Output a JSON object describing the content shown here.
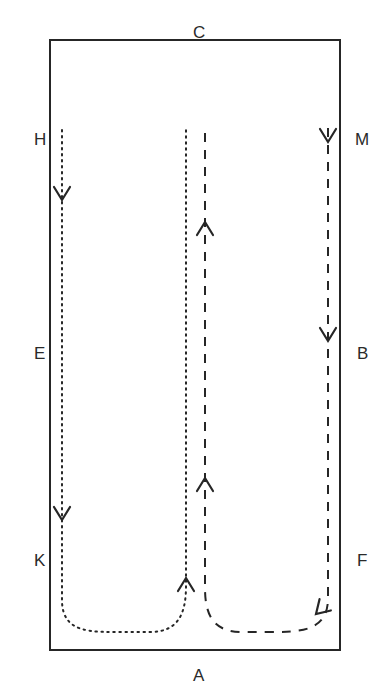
{
  "figure": {
    "type": "flow-diagram",
    "background_color": "#ffffff",
    "stroke_color": "#262626",
    "width": 387,
    "height": 698
  },
  "boundary": {
    "name": "rectangle-boundary",
    "x": 50,
    "y": 40,
    "width": 290,
    "height": 610,
    "stroke_width": 2,
    "stroke_color": "#262626",
    "fill": "none"
  },
  "labels": [
    {
      "id": "label-c",
      "text": "C",
      "x": 193,
      "y": 24,
      "side": "top"
    },
    {
      "id": "label-h",
      "text": "H",
      "x": 34,
      "y": 131,
      "side": "left"
    },
    {
      "id": "label-m",
      "text": "M",
      "x": 355,
      "y": 131,
      "side": "right"
    },
    {
      "id": "label-e",
      "text": "E",
      "x": 34,
      "y": 345,
      "side": "left"
    },
    {
      "id": "label-b",
      "text": "B",
      "x": 357,
      "y": 345,
      "side": "right"
    },
    {
      "id": "label-k",
      "text": "K",
      "x": 34,
      "y": 552,
      "side": "left"
    },
    {
      "id": "label-f",
      "text": "F",
      "x": 357,
      "y": 552,
      "side": "right"
    },
    {
      "id": "label-a",
      "text": "A",
      "x": 193,
      "y": 667,
      "side": "bottom"
    }
  ],
  "paths": [
    {
      "id": "dotted-path",
      "style": "dotted",
      "dasharray": "1.5,4.5",
      "stroke_width": 2,
      "stroke_color": "#262626",
      "description": "descends along left side from H, U-turns at bottom near A, ascends through centre",
      "d": "M 62 130 L 62 600 C 62 634 92 632 124 632 L 150 632 C 178 632 186 614 186 586 L 186 130"
    },
    {
      "id": "dashed-path",
      "style": "dashed",
      "dasharray": "9,8",
      "stroke_width": 2,
      "stroke_color": "#262626",
      "description": "descends along right side from M, U-turns at bottom near A, ascends through centre",
      "d": "M 328 128 L 328 598 C 328 632 300 632 268 632 L 242 632 C 214 632 205 616 205 588 L 205 130"
    }
  ],
  "arrowheads": [
    {
      "id": "arrow-left-upper",
      "x": 62,
      "y": 200,
      "direction": "down",
      "on": "dotted-path"
    },
    {
      "id": "arrow-left-lower",
      "x": 62,
      "y": 520,
      "direction": "down",
      "on": "dotted-path"
    },
    {
      "id": "arrow-centre-dotted",
      "x": 186,
      "y": 578,
      "direction": "up",
      "on": "dotted-path"
    },
    {
      "id": "arrow-right-upper",
      "x": 328,
      "y": 142,
      "direction": "down",
      "on": "dashed-path"
    },
    {
      "id": "arrow-right-lower",
      "x": 328,
      "y": 341,
      "direction": "down",
      "on": "dashed-path"
    },
    {
      "id": "arrow-bottom-right",
      "x": 316,
      "y": 614,
      "direction": "down-left",
      "on": "dashed-path"
    },
    {
      "id": "arrow-centre-dashed-lower",
      "x": 205,
      "y": 478,
      "direction": "up",
      "on": "dashed-path"
    },
    {
      "id": "arrow-centre-dashed-upper",
      "x": 205,
      "y": 222,
      "direction": "up",
      "on": "dashed-path"
    }
  ]
}
